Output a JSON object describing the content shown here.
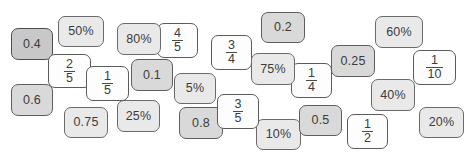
{
  "activity": {
    "title": "Equivalent value cards",
    "description": "Scattered overlapping rounded cards showing decimals, fractions and percentages"
  },
  "palette": {
    "white": "#fdfdfd",
    "light": "#e9e9e9",
    "medium": "#d9d9d9",
    "dark": "#c8c8c8",
    "border": "#5b5b5b",
    "text": "#3c3c3c",
    "background": "#ffffff"
  },
  "cards": [
    {
      "id": "card-0-4",
      "label": "0.4",
      "kind": "decimal",
      "tone": "dark",
      "x": 11,
      "y": 28,
      "w": 42,
      "h": 32,
      "z": 3
    },
    {
      "id": "card-50pct",
      "label": "50%",
      "kind": "percent",
      "tone": "light",
      "x": 58,
      "y": 16,
      "w": 46,
      "h": 31,
      "z": 2
    },
    {
      "id": "card-2-5",
      "label": "2/5",
      "kind": "fraction",
      "tone": "white",
      "x": 48,
      "y": 54,
      "w": 43,
      "h": 34,
      "z": 5,
      "num": "2",
      "den": "5"
    },
    {
      "id": "card-1-5",
      "label": "1/5",
      "kind": "fraction",
      "tone": "white",
      "x": 86,
      "y": 66,
      "w": 43,
      "h": 35,
      "z": 6,
      "num": "1",
      "den": "5"
    },
    {
      "id": "card-0-6",
      "label": "0.6",
      "kind": "decimal",
      "tone": "medium",
      "x": 11,
      "y": 84,
      "w": 42,
      "h": 32,
      "z": 4
    },
    {
      "id": "card-0-75",
      "label": "0.75",
      "kind": "decimal",
      "tone": "light",
      "x": 64,
      "y": 107,
      "w": 44,
      "h": 31,
      "z": 3
    },
    {
      "id": "card-25pct",
      "label": "25%",
      "kind": "percent",
      "tone": "light",
      "x": 117,
      "y": 100,
      "w": 43,
      "h": 32,
      "z": 2
    },
    {
      "id": "card-80pct",
      "label": "80%",
      "kind": "percent",
      "tone": "light",
      "x": 117,
      "y": 23,
      "w": 44,
      "h": 32,
      "z": 4
    },
    {
      "id": "card-4-5",
      "label": "4/5",
      "kind": "fraction",
      "tone": "white",
      "x": 157,
      "y": 23,
      "w": 41,
      "h": 35,
      "z": 3,
      "num": "4",
      "den": "5"
    },
    {
      "id": "card-0-1",
      "label": "0.1",
      "kind": "decimal",
      "tone": "medium",
      "x": 131,
      "y": 59,
      "w": 42,
      "h": 32,
      "z": 5
    },
    {
      "id": "card-5pct",
      "label": "5%",
      "kind": "percent",
      "tone": "light",
      "x": 174,
      "y": 73,
      "w": 42,
      "h": 31,
      "z": 3
    },
    {
      "id": "card-0-8",
      "label": "0.8",
      "kind": "decimal",
      "tone": "medium",
      "x": 179,
      "y": 107,
      "w": 44,
      "h": 32,
      "z": 3
    },
    {
      "id": "card-3-5",
      "label": "3/5",
      "kind": "fraction",
      "tone": "white",
      "x": 217,
      "y": 94,
      "w": 42,
      "h": 35,
      "z": 6,
      "num": "3",
      "den": "5"
    },
    {
      "id": "card-10pct",
      "label": "10%",
      "kind": "percent",
      "tone": "light",
      "x": 256,
      "y": 119,
      "w": 45,
      "h": 31,
      "z": 2
    },
    {
      "id": "card-3-4",
      "label": "3/4",
      "kind": "fraction",
      "tone": "white",
      "x": 211,
      "y": 35,
      "w": 41,
      "h": 35,
      "z": 4,
      "num": "3",
      "den": "4"
    },
    {
      "id": "card-0-2",
      "label": "0.2",
      "kind": "decimal",
      "tone": "medium",
      "x": 261,
      "y": 12,
      "w": 44,
      "h": 31,
      "z": 3
    },
    {
      "id": "card-75pct",
      "label": "75%",
      "kind": "percent",
      "tone": "light",
      "x": 251,
      "y": 53,
      "w": 44,
      "h": 32,
      "z": 5
    },
    {
      "id": "card-1-4",
      "label": "1/4",
      "kind": "fraction",
      "tone": "white",
      "x": 291,
      "y": 63,
      "w": 41,
      "h": 35,
      "z": 4,
      "num": "1",
      "den": "4"
    },
    {
      "id": "card-0-5",
      "label": "0.5",
      "kind": "decimal",
      "tone": "medium",
      "x": 299,
      "y": 105,
      "w": 43,
      "h": 31,
      "z": 3
    },
    {
      "id": "card-1-2",
      "label": "1/2",
      "kind": "fraction",
      "tone": "white",
      "x": 347,
      "y": 114,
      "w": 41,
      "h": 35,
      "z": 2,
      "num": "1",
      "den": "2"
    },
    {
      "id": "card-0-25",
      "label": "0.25",
      "kind": "decimal",
      "tone": "medium",
      "x": 331,
      "y": 45,
      "w": 44,
      "h": 32,
      "z": 4
    },
    {
      "id": "card-60pct",
      "label": "60%",
      "kind": "percent",
      "tone": "light",
      "x": 375,
      "y": 16,
      "w": 48,
      "h": 32,
      "z": 3
    },
    {
      "id": "card-40pct",
      "label": "40%",
      "kind": "percent",
      "tone": "light",
      "x": 371,
      "y": 79,
      "w": 44,
      "h": 32,
      "z": 3
    },
    {
      "id": "card-1-10",
      "label": "1/10",
      "kind": "fraction",
      "tone": "white",
      "x": 413,
      "y": 50,
      "w": 43,
      "h": 35,
      "z": 4,
      "num": "1",
      "den": "10"
    },
    {
      "id": "card-20pct",
      "label": "20%",
      "kind": "percent",
      "tone": "light",
      "x": 419,
      "y": 107,
      "w": 45,
      "h": 31,
      "z": 2
    }
  ]
}
